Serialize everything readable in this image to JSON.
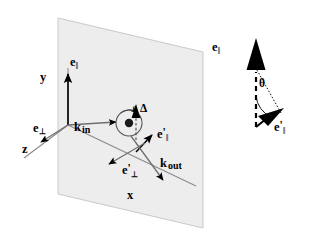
{
  "figure": {
    "type": "vector-geometry-diagram",
    "background_color": "#ffffff",
    "ink_color": "#000000",
    "plane_fill_color": "#ededed",
    "plane_edge_color": "#c8c8c8"
  },
  "main_panel": {
    "plane_name": "scattering-plane",
    "axes": [
      {
        "name": "y-axis",
        "label": "y",
        "direction": "up",
        "x": 40,
        "y": 78
      },
      {
        "name": "x-axis",
        "label": "x",
        "direction": "down-right",
        "x": 127,
        "y": 196
      },
      {
        "name": "z-axis",
        "label": "z",
        "direction": "down-left",
        "x": 22,
        "y": 150
      }
    ],
    "vectors": [
      {
        "name": "e-parallel-in",
        "label_base": "e",
        "label_sub": "‖",
        "prime": false,
        "x": 73,
        "y": 63,
        "direction": "up"
      },
      {
        "name": "e-perp-in",
        "label_base": "e",
        "label_sub": "⊥",
        "prime": false,
        "x": 36,
        "y": 128,
        "direction": "down-left"
      },
      {
        "name": "k-in",
        "label_base": "k",
        "label_sub": "in",
        "prime": false,
        "x": 77,
        "y": 128,
        "direction": "right"
      },
      {
        "name": "e-parallel-out",
        "label_base": "e",
        "label_sub": "‖",
        "prime": true,
        "x": 160,
        "y": 132,
        "direction": "up-right"
      },
      {
        "name": "e-perp-out",
        "label_base": "e",
        "label_sub": "⊥",
        "prime": true,
        "x": 126,
        "y": 169,
        "direction": "down-left"
      },
      {
        "name": "k-out",
        "label_base": "k",
        "label_sub": "out",
        "prime": false,
        "x": 163,
        "y": 163,
        "direction": "down-right"
      },
      {
        "name": "delta-vector",
        "label_base": "Δ",
        "label_sub": "",
        "prime": false,
        "x": 140,
        "y": 110,
        "direction": "up"
      }
    ],
    "scatterer": {
      "name": "scattering-center",
      "center_x": 129,
      "center_y": 123,
      "radius": 13,
      "spin_label": "σ",
      "spin_direction": "counterclockwise"
    }
  },
  "inset_panel": {
    "name": "polarization-rotation-inset",
    "angle_label": "θ",
    "angle_label_x": 257,
    "angle_label_y": 83,
    "vectors": [
      {
        "name": "e-parallel-in-inset",
        "label_base": "e",
        "label_sub": "‖",
        "prime": false,
        "x": 215,
        "y": 48,
        "direction": "up"
      },
      {
        "name": "e-parallel-out-inset",
        "label_base": "e",
        "label_sub": "‖",
        "prime": true,
        "x": 277,
        "y": 126,
        "direction": "up-right"
      }
    ]
  }
}
